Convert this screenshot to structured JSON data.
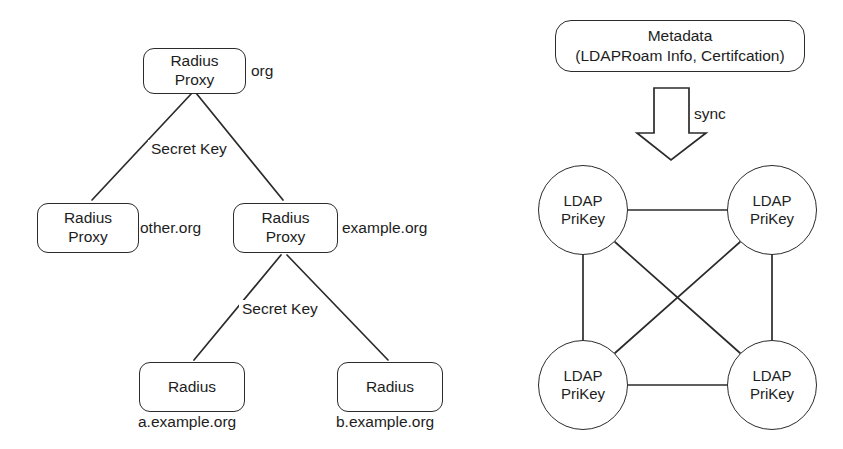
{
  "figure": {
    "stroke_color": "#2b2b2b",
    "text_color": "#1d1d1d",
    "background_color": "#ffffff"
  },
  "left_panel": {
    "name": "radius-proxy-tree",
    "nodes": {
      "root": {
        "line1": "Radius",
        "line2": "Proxy",
        "realm": "org"
      },
      "other_proxy": {
        "line1": "Radius",
        "line2": "Proxy",
        "realm": "other.org"
      },
      "example_proxy": {
        "line1": "Radius",
        "line2": "Proxy",
        "realm": "example.org"
      },
      "leaf_a": {
        "line1": "Radius",
        "realm": "a.example.org"
      },
      "leaf_b": {
        "line1": "Radius",
        "realm": "b.example.org"
      }
    },
    "edge_labels": {
      "upper": "Secret Key",
      "lower": "Secret Key"
    }
  },
  "right_panel": {
    "name": "ldap-prikey-mesh",
    "metadata_box": {
      "line1": "Metadata",
      "line2": "(LDAPRoam Info, Certifcation)"
    },
    "arrow_label": "sync",
    "arrow_icon": "down-block-arrow-icon",
    "circles": [
      {
        "id": "top-left",
        "line1": "LDAP",
        "line2": "PriKey"
      },
      {
        "id": "top-right",
        "line1": "LDAP",
        "line2": "PriKey"
      },
      {
        "id": "bottom-left",
        "line1": "LDAP",
        "line2": "PriKey"
      },
      {
        "id": "bottom-right",
        "line1": "LDAP",
        "line2": "PriKey"
      }
    ]
  }
}
